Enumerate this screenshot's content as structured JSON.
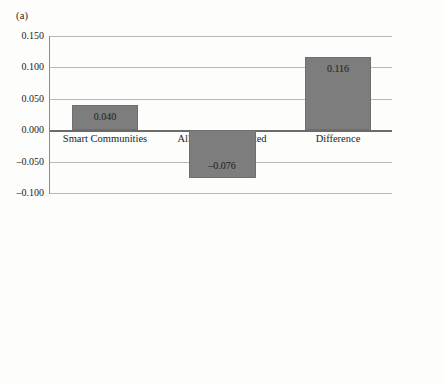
{
  "figure": {
    "panel_a_label": "(a)",
    "panel_b_label": "(b)",
    "bar_color": "#7d7d7d",
    "grid_color": "#b9b9b9",
    "axis_color": "#6b6b6b"
  },
  "chart_data": [
    {
      "type": "bar",
      "panel": "(a)",
      "title": "",
      "xlabel": "",
      "ylabel": "",
      "categories": [
        "Smart Communities",
        "All Other Nontreated Neighborhoods",
        "Difference"
      ],
      "category_lines": [
        [
          "Smart Communities"
        ],
        [
          "All Other Nontreated",
          "Neighborhoods"
        ],
        [
          "Difference"
        ]
      ],
      "values": [
        0.04,
        -0.076,
        0.116
      ],
      "value_labels": [
        "0.040",
        "–0.076",
        "0.116"
      ],
      "ylim": [
        -0.1,
        0.15
      ],
      "ytick_step": 0.05,
      "ytick_labels": [
        "0.150",
        "0.100",
        "0.050",
        "0.000",
        "–0.050",
        "–0.100"
      ],
      "ytick_values": [
        0.15,
        0.1,
        0.05,
        0.0,
        -0.05,
        -0.1
      ],
      "grid": true,
      "legend": "none",
      "zero_line": true
    },
    {
      "type": "bar",
      "panel": "(b)",
      "title": "",
      "xlabel": "",
      "ylabel": "",
      "categories": [
        "Smart Communities",
        "All Other Nontreated Neighborhoods",
        "Difference"
      ],
      "category_lines": [
        [
          "Smart Communities"
        ],
        [
          "All Other Nontreated",
          "Neighborhoods"
        ],
        [
          "Difference"
        ]
      ],
      "values": [
        0.174,
        0.066,
        0.108
      ],
      "value_labels": [
        "0.174",
        "0.066",
        "0.108"
      ],
      "ylim": [
        0.0,
        0.2
      ],
      "ytick_step": 0.02,
      "ytick_labels": [
        "0.200",
        "0.180",
        "0.160",
        "0.140",
        "0.120",
        "0.100",
        "0.080",
        "0.060",
        "0.040",
        "0.020",
        "0.000"
      ],
      "ytick_values": [
        0.2,
        0.18,
        0.16,
        0.14,
        0.12,
        0.1,
        0.08,
        0.06,
        0.04,
        0.02,
        0.0
      ],
      "grid": true,
      "legend": "none",
      "zero_line": false
    }
  ]
}
